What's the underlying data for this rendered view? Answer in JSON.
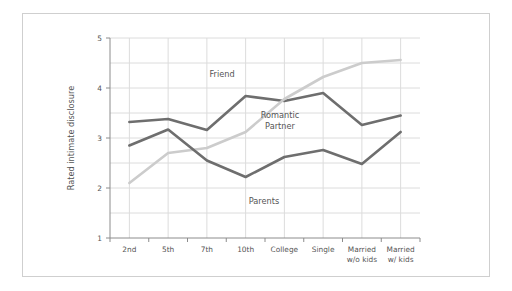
{
  "chart_data": {
    "type": "line",
    "title": "",
    "xlabel": "",
    "ylabel": "Rated intimate disclosure",
    "ylim": [
      1,
      5
    ],
    "yticks": [
      1,
      2,
      3,
      4,
      5
    ],
    "ytick_labels": [
      "1",
      "2",
      "3",
      "4",
      "5"
    ],
    "grid": true,
    "grid_y_minor_step": 0.5,
    "grid_x": true,
    "legend_position": "inline-annotations",
    "categories": [
      "2nd",
      "5th",
      "7th",
      "10th",
      "College",
      "Single",
      "Married w/o kids",
      "Married w/ kids"
    ],
    "category_labels_multiline": [
      [
        "2nd"
      ],
      [
        "5th"
      ],
      [
        "7th"
      ],
      [
        "10th"
      ],
      [
        "College"
      ],
      [
        "Single"
      ],
      [
        "Married",
        "w/o kids"
      ],
      [
        "Married",
        "w/ kids"
      ]
    ],
    "series": [
      {
        "name": "Friend",
        "color": "#6e6e6e",
        "values": [
          3.32,
          3.38,
          3.16,
          3.84,
          3.74,
          3.9,
          3.26,
          3.45
        ]
      },
      {
        "name": "Romantic Partner",
        "color": "#cccccc",
        "values": [
          2.1,
          2.7,
          2.8,
          3.12,
          3.78,
          4.22,
          4.5,
          4.56
        ]
      },
      {
        "name": "Parents",
        "color": "#6e6e6e",
        "values": [
          2.85,
          3.17,
          2.55,
          2.22,
          2.62,
          2.76,
          2.48,
          3.12
        ]
      }
    ],
    "annotations": [
      {
        "text": "Friend",
        "series": "Friend",
        "x_px": 222,
        "y_px": 77
      },
      {
        "text": "Romantic",
        "series": "Romantic Partner",
        "x_px": 280,
        "y_px": 118
      },
      {
        "text": "Partner",
        "series": "Romantic Partner",
        "x_px": 280,
        "y_px": 129
      },
      {
        "text": "Parents",
        "series": "Parents",
        "x_px": 264,
        "y_px": 204
      }
    ],
    "colors": {
      "dark_line": "#6e6e6e",
      "light_line": "#cccccc",
      "grid": "#dcdcdc",
      "axis": "#8c8c8c",
      "text": "#555555",
      "figure_border": "#cfcfcf",
      "background": "#ffffff"
    }
  }
}
